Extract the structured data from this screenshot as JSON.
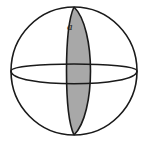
{
  "figure": {
    "name": "spherical-lune-diagram",
    "background_color": "#ffffff",
    "label": "a",
    "label_meaning": "dihedral angle of the lune at the pole"
  },
  "style": {
    "outline_color": "#1a1a1a",
    "lune_fill": "#a8a8a8",
    "lune_stroke": "#1a1a1a",
    "sphere_fill": "#ffffff",
    "stroke_width": "1.6",
    "thin_stroke_width": "1.3"
  },
  "geometry": {
    "sphere_center_x": 74,
    "sphere_center_y": 71,
    "sphere_radius_x": 63,
    "sphere_radius_y": 64,
    "north_pole_x": 74,
    "north_pole_y": 7,
    "south_pole_x": 74,
    "south_pole_y": 135,
    "equator_semi_minor": 17,
    "meridian_front_semi_minor": 10,
    "lune_left_semi_minor": 10,
    "lune_right_semi_minor": 22,
    "lune_width_at_equator": 32
  }
}
